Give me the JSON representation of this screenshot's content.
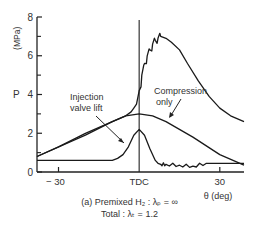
{
  "chart_data": {
    "type": "line",
    "title": "",
    "caption_line1": "(a) Premixed H₂ : λₚ = ∞",
    "caption_line2": "Total : λₜ = 1.2",
    "xlabel": "θ   (deg)",
    "ylabel_symbol": "P",
    "ylabel_unit": "(MPa)",
    "xlim": [
      -38,
      39
    ],
    "ylim": [
      0,
      8
    ],
    "x_ticks": [
      {
        "value": -30,
        "label": "− 30"
      },
      {
        "value": 0,
        "label": "TDC"
      },
      {
        "value": 30,
        "label": "30"
      }
    ],
    "y_ticks": [
      {
        "value": 0,
        "label": "0"
      },
      {
        "value": 2,
        "label": "2"
      },
      {
        "value": 4,
        "label": "4"
      },
      {
        "value": 6,
        "label": "6"
      },
      {
        "value": 8,
        "label": "8"
      }
    ],
    "y_minor_ticks": [
      1,
      3,
      5,
      7
    ],
    "grid": false,
    "legend": "none (inline annotations)",
    "annotations": [
      {
        "text_line1": "Injection",
        "text_line2": "valve lift",
        "points_to": "injection_valve_lift"
      },
      {
        "text_line1": "Compression",
        "text_line2": "only",
        "points_to": "compression_only"
      }
    ],
    "vertical_line": {
      "x": 0,
      "label": "TDC"
    },
    "series": [
      {
        "name": "Combustion pressure",
        "x": [
          -38,
          -20,
          -10,
          -5,
          -3,
          -2,
          -1,
          0,
          1,
          2,
          3,
          4,
          5,
          6,
          7,
          8,
          10,
          12,
          15,
          18,
          22,
          26,
          30,
          34,
          39
        ],
        "y": [
          0.8,
          1.9,
          2.6,
          2.9,
          3.1,
          3.3,
          3.5,
          4.2,
          5.0,
          5.6,
          6.0,
          6.3,
          6.6,
          6.8,
          6.9,
          7.0,
          6.9,
          6.7,
          6.3,
          5.6,
          4.7,
          3.9,
          3.3,
          2.9,
          2.6
        ]
      },
      {
        "name": "Compression only",
        "x": [
          -38,
          -30,
          -20,
          -10,
          -5,
          0,
          5,
          10,
          20,
          30,
          39
        ],
        "y": [
          0.8,
          1.3,
          2.0,
          2.6,
          2.9,
          3.0,
          2.9,
          2.6,
          1.8,
          0.9,
          0.35
        ]
      },
      {
        "name": "Injection valve lift",
        "x": [
          -38,
          -20,
          -10,
          -8,
          -6,
          -4,
          -2,
          0,
          2,
          4,
          6,
          7,
          8,
          10,
          15,
          20,
          25,
          30,
          39
        ],
        "y": [
          0.6,
          0.6,
          0.6,
          0.7,
          0.9,
          1.3,
          1.9,
          2.2,
          1.9,
          1.2,
          0.6,
          0.45,
          0.4,
          0.4,
          0.35,
          0.3,
          0.45,
          0.45,
          0.45
        ]
      }
    ]
  }
}
